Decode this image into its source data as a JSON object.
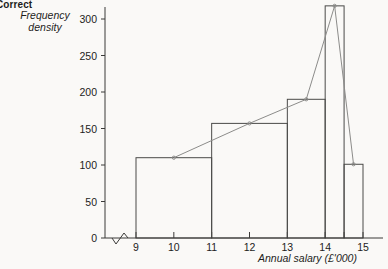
{
  "heading": "Correct",
  "axis_titles": {
    "y": "Frequency\ndensity",
    "y_line1": "Frequency",
    "y_line2": "density",
    "x": "Annual salary (£'000)"
  },
  "colors": {
    "background": "#faf9f7",
    "axis": "#3a3a38",
    "bar_outline": "#4a4a48",
    "polygon_line": "#8c8c8a",
    "text": "#1d1d1b"
  },
  "chart_data": {
    "type": "bar",
    "title": "Correct",
    "xlabel": "Annual salary (£'000)",
    "ylabel": "Frequency density",
    "xlim": [
      9,
      15
    ],
    "ylim": [
      0,
      320
    ],
    "grid": false,
    "legend": null,
    "x_ticks": [
      9,
      10,
      11,
      12,
      13,
      14,
      14.5,
      15
    ],
    "x_tick_labels": [
      "9",
      "10",
      "11",
      "12",
      "13",
      "14",
      "",
      "15"
    ],
    "y_ticks": [
      0,
      50,
      100,
      150,
      200,
      250,
      300
    ],
    "y_tick_labels": [
      "0",
      "50",
      "100",
      "150",
      "200",
      "250",
      "300"
    ],
    "x_axis_break": true,
    "bars": [
      {
        "x_start": 9,
        "x_end": 11,
        "height": 110
      },
      {
        "x_start": 11,
        "x_end": 13,
        "height": 157
      },
      {
        "x_start": 13,
        "x_end": 14,
        "height": 190
      },
      {
        "x_start": 14,
        "x_end": 14.5,
        "height": 318
      },
      {
        "x_start": 14.5,
        "x_end": 15,
        "height": 101
      }
    ],
    "frequency_polygon": {
      "name": "Frequency polygon",
      "points": [
        {
          "x": 10,
          "y": 110
        },
        {
          "x": 12,
          "y": 157
        },
        {
          "x": 13.5,
          "y": 190
        },
        {
          "x": 14.25,
          "y": 318
        },
        {
          "x": 14.75,
          "y": 101
        }
      ]
    }
  }
}
